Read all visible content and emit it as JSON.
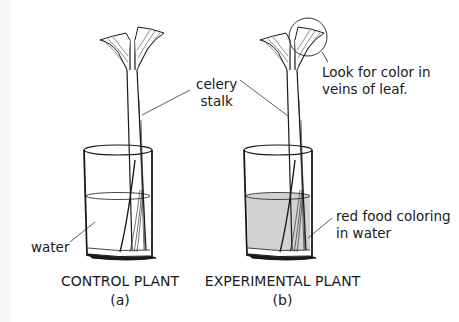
{
  "figure": {
    "labels": {
      "celery_stalk_line1": "celery",
      "celery_stalk_line2": "stalk",
      "leaf_note_line1": "Look for color in",
      "leaf_note_line2": "veins of leaf.",
      "water": "water",
      "red_food_line1": "red food coloring",
      "red_food_line2": "in water"
    },
    "captions": {
      "control_title": "CONTROL PLANT",
      "control_sub": "(a)",
      "experimental_title": "EXPERIMENTAL PLANT",
      "experimental_sub": "(b)"
    },
    "colors": {
      "clear_water": "#ffffff",
      "colored_water": "#d2d2d2",
      "ink": "#1a1a1a"
    }
  }
}
